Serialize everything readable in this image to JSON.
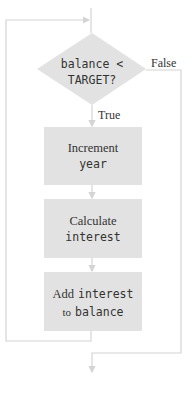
{
  "colors": {
    "line": "#d4d4d4",
    "box_fill": "#e2e2e2",
    "text": "#333333"
  },
  "decision": {
    "line1": "balance <",
    "line2": "TARGET?",
    "true_label": "True",
    "false_label": "False"
  },
  "steps": [
    {
      "text": "Increment",
      "code": "year"
    },
    {
      "text": "Calculate",
      "code": "interest"
    },
    {
      "text_prefix": "Add",
      "code1": "interest",
      "text_mid": "to",
      "code2": "balance"
    }
  ]
}
